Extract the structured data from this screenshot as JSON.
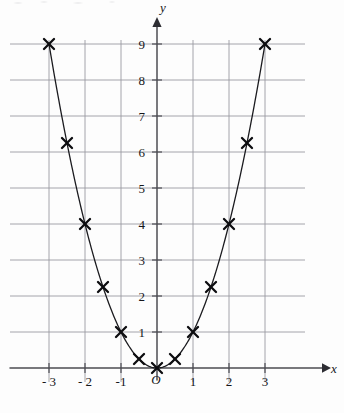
{
  "chart_data": {
    "type": "scatter",
    "title": "",
    "xlabel": "x",
    "ylabel": "y",
    "origin_label": "O",
    "x": [
      -3,
      -2.5,
      -2,
      -1.5,
      -1,
      -0.5,
      0,
      0.5,
      1,
      1.5,
      2,
      2.5,
      3
    ],
    "values": [
      9,
      6.25,
      4,
      2.25,
      1,
      0.25,
      0,
      0.25,
      1,
      2.25,
      4,
      6.25,
      9
    ],
    "series": [
      {
        "name": "y = x^2",
        "values": [
          9,
          6.25,
          4,
          2.25,
          1,
          0.25,
          0,
          0.25,
          1,
          2.25,
          4,
          6.25,
          9
        ]
      }
    ],
    "marker": "cross",
    "curve": true,
    "grid": true,
    "legend": "none",
    "xlim": [
      -3.35,
      3.35
    ],
    "ylim": [
      -0.3,
      9.6
    ],
    "xticks": [
      -3,
      -2,
      -1,
      1,
      2,
      3
    ],
    "yticks": [
      1,
      2,
      3,
      4,
      5,
      6,
      7,
      8,
      9
    ],
    "xtick_labels": [
      "- 3",
      "- 2",
      "-1",
      "1",
      "2",
      "3"
    ],
    "ytick_labels": [
      "1",
      "2",
      "3",
      "4",
      "5",
      "6",
      "7",
      "8",
      "9"
    ],
    "x_grid_values": [
      -3,
      -2,
      -1,
      0,
      1,
      2,
      3
    ],
    "y_grid_values": [
      1,
      2,
      3,
      4,
      5,
      6,
      7,
      8,
      9
    ]
  },
  "colors": {
    "background": "#fdfdfd",
    "grid": "#9a9aa2",
    "axis": "#4c4c52",
    "curve": "#1b1b1f",
    "marker": "#0d0d10",
    "text": "#16161a"
  }
}
